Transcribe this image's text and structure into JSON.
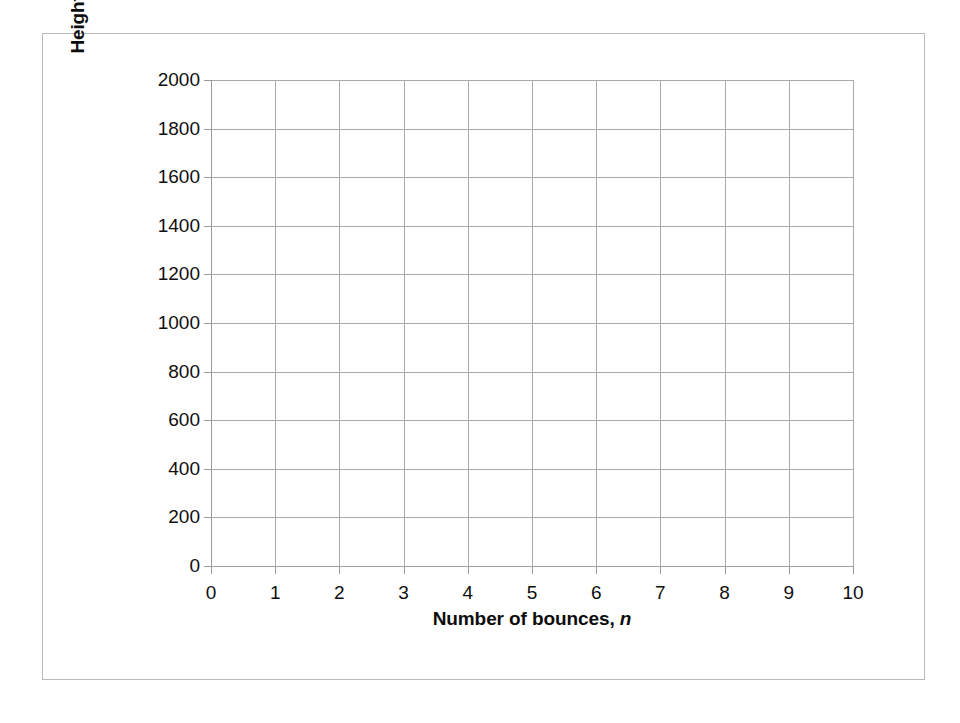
{
  "chart_data": {
    "type": "line",
    "title": "",
    "subtitle": "",
    "xlabel_text": "Number of bounces, ",
    "xlabel_italic": "n",
    "ylabel_text": "Height in mm of basketball, ",
    "ylabel_italic": "f(n)",
    "xlim": [
      0,
      10
    ],
    "ylim": [
      0,
      2000
    ],
    "x_ticks": [
      "0",
      "1",
      "2",
      "3",
      "4",
      "5",
      "6",
      "7",
      "8",
      "9",
      "10"
    ],
    "y_ticks": [
      "0",
      "200",
      "400",
      "600",
      "800",
      "1000",
      "1200",
      "1400",
      "1600",
      "1800",
      "2000"
    ],
    "x_tick_values": [
      0,
      1,
      2,
      3,
      4,
      5,
      6,
      7,
      8,
      9,
      10
    ],
    "y_tick_values": [
      0,
      200,
      400,
      600,
      800,
      1000,
      1200,
      1400,
      1600,
      1800,
      2000
    ],
    "grid": true,
    "grid_axes": "both",
    "legend": false,
    "legend_position": "none",
    "series": [],
    "values": [],
    "categories": [],
    "annotations": [],
    "note": "empty grid — no data plotted"
  },
  "colors": {
    "gridline": "#a9a9a9",
    "axis_line": "#989898",
    "frame_border": "#b9b9b9",
    "text": "#0f0f0f",
    "background": "#ffffff"
  }
}
